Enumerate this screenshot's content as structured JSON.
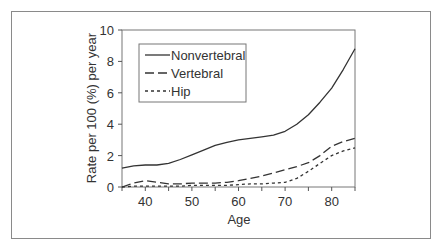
{
  "chart_data": {
    "type": "line",
    "title": "",
    "xlabel": "Age",
    "ylabel": "Rate per 100 (%) per year",
    "xlim": [
      35,
      85
    ],
    "ylim": [
      0,
      10
    ],
    "xticks": [
      40,
      50,
      60,
      70,
      80
    ],
    "yticks": [
      0,
      2,
      4,
      6,
      8,
      10
    ],
    "grid": false,
    "legend_position": "upper left",
    "x": [
      35,
      37.5,
      40,
      42.5,
      45,
      47.5,
      50,
      52.5,
      55,
      57.5,
      60,
      62.5,
      65,
      67.5,
      70,
      72.5,
      75,
      77.5,
      80,
      82.5,
      85
    ],
    "series": [
      {
        "name": "Nonvertebral",
        "style": "solid",
        "values": [
          1.2,
          1.35,
          1.4,
          1.4,
          1.5,
          1.75,
          2.05,
          2.35,
          2.65,
          2.85,
          3.0,
          3.1,
          3.2,
          3.3,
          3.55,
          4.0,
          4.6,
          5.4,
          6.3,
          7.5,
          8.8
        ]
      },
      {
        "name": "Vertebral",
        "style": "long-dash",
        "values": [
          0.0,
          0.25,
          0.4,
          0.3,
          0.2,
          0.2,
          0.25,
          0.25,
          0.25,
          0.3,
          0.4,
          0.55,
          0.7,
          0.9,
          1.1,
          1.3,
          1.55,
          2.0,
          2.6,
          2.9,
          3.1
        ]
      },
      {
        "name": "Hip",
        "style": "short-dash",
        "values": [
          0.0,
          0.05,
          0.05,
          0.05,
          0.05,
          0.05,
          0.1,
          0.1,
          0.1,
          0.1,
          0.15,
          0.2,
          0.2,
          0.25,
          0.3,
          0.55,
          1.0,
          1.5,
          2.0,
          2.3,
          2.5
        ]
      }
    ]
  },
  "legend": {
    "items": [
      "Nonvertebral",
      "Vertebral",
      "Hip"
    ]
  },
  "axes": {
    "xlabel": "Age",
    "ylabel": "Rate per 100 (%) per year",
    "xtick_labels": [
      "40",
      "50",
      "60",
      "70",
      "80"
    ],
    "ytick_labels": [
      "0",
      "2",
      "4",
      "6",
      "8",
      "10"
    ]
  }
}
